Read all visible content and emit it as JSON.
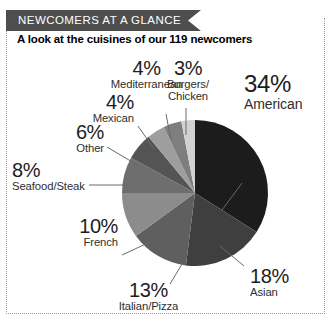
{
  "header": {
    "ribbon_title": "NEWCOMERS AT A GLANCE",
    "ribbon_color": "#4e4e4e",
    "subtitle": "A look at the cuisines of our 119 newcomers"
  },
  "chart_data": {
    "type": "pie",
    "title": "A look at the cuisines of our 119 newcomers",
    "total_label": "119 newcomers",
    "categories": [
      "American",
      "Asian",
      "Italian/Pizza",
      "French",
      "Seafood/Steak",
      "Other",
      "Mexican",
      "Mediterranean",
      "Burgers/Chicken"
    ],
    "values": [
      34,
      18,
      13,
      10,
      8,
      6,
      4,
      4,
      3
    ],
    "value_suffix": "%",
    "colors": [
      "#1c1c1c",
      "#3f3f3f",
      "#5f5f5f",
      "#8c8c8c",
      "#6e6e6e",
      "#545454",
      "#9e9e9e",
      "#7e7e7e",
      "#d2d2d2"
    ],
    "start_angle_deg": 0,
    "direction": "clockwise",
    "legend": "labels-outside",
    "grid": false,
    "xlabel": "",
    "ylabel": ""
  },
  "labels": {
    "american": {
      "pct": "34%",
      "name": "American"
    },
    "asian": {
      "pct": "18%",
      "name": "Asian"
    },
    "italian": {
      "pct": "13%",
      "name": "Italian/Pizza"
    },
    "french": {
      "pct": "10%",
      "name": "French"
    },
    "seafood": {
      "pct": "8%",
      "name": "Seafood/Steak"
    },
    "other": {
      "pct": "6%",
      "name": "Other"
    },
    "mexican": {
      "pct": "4%",
      "name": "Mexican"
    },
    "mediterranean": {
      "pct": "4%",
      "name": "Mediterranean"
    },
    "burgers": {
      "pct": "3%",
      "name_line1": "Burgers/",
      "name_line2": "Chicken"
    }
  }
}
